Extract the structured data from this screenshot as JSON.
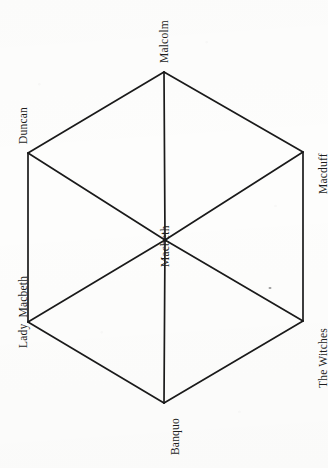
{
  "diagram": {
    "type": "hexagonal-character-relationship-diagram",
    "orientation": "rotated-90-counterclockwise",
    "background_color": "#fdfdfc",
    "line_color": "#1a1a1a",
    "text_color": "#1d1d1d",
    "center": {
      "id": "macbeth",
      "label": "Macbeth",
      "x": 165,
      "y": 240
    },
    "vertices": [
      {
        "id": "malcolm",
        "label": "Malcolm",
        "x": 164,
        "y": 72,
        "label_x": 159,
        "label_y": 63,
        "position": "top"
      },
      {
        "id": "macduff",
        "label": "Macduff",
        "x": 303,
        "y": 152,
        "label_x": 318,
        "label_y": 194,
        "position": "upper-right"
      },
      {
        "id": "the-witches",
        "label": "The Witches",
        "x": 303,
        "y": 321,
        "label_x": 318,
        "label_y": 388,
        "position": "lower-right"
      },
      {
        "id": "banquo",
        "label": "Banquo",
        "x": 164,
        "y": 403,
        "label_x": 170,
        "label_y": 455,
        "position": "bottom"
      },
      {
        "id": "lady-macbeth",
        "label": "Lady  Macbeth",
        "x": 28,
        "y": 322,
        "label_x": 18,
        "label_y": 348,
        "position": "lower-left"
      },
      {
        "id": "duncan",
        "label": "Duncan",
        "x": 28,
        "y": 153,
        "label_x": 18,
        "label_y": 144,
        "position": "upper-left"
      }
    ],
    "perimeter_edges": [
      {
        "from": "malcolm",
        "to": "macduff"
      },
      {
        "from": "macduff",
        "to": "the-witches"
      },
      {
        "from": "the-witches",
        "to": "banquo"
      },
      {
        "from": "banquo",
        "to": "lady-macbeth"
      },
      {
        "from": "lady-macbeth",
        "to": "duncan"
      },
      {
        "from": "duncan",
        "to": "malcolm"
      }
    ],
    "spoke_edges": [
      {
        "from": "macbeth",
        "to": "malcolm"
      },
      {
        "from": "macbeth",
        "to": "macduff"
      },
      {
        "from": "macbeth",
        "to": "the-witches"
      },
      {
        "from": "macbeth",
        "to": "banquo"
      },
      {
        "from": "macbeth",
        "to": "lady-macbeth"
      },
      {
        "from": "macbeth",
        "to": "duncan"
      }
    ],
    "center_label": {
      "label": "Macbeth",
      "label_x": 160,
      "label_y": 267
    },
    "artifacts": [
      {
        "id": "scan-speck",
        "x": 270,
        "y": 288,
        "w": 3,
        "h": 2
      }
    ]
  }
}
